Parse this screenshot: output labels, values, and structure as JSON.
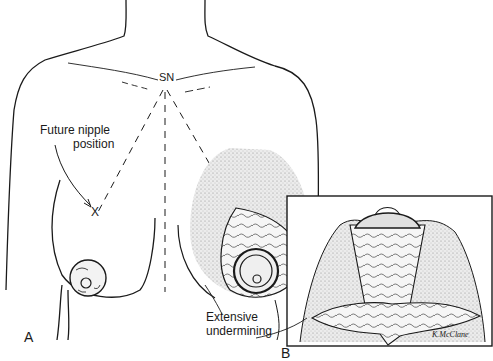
{
  "figure": {
    "panels": [
      {
        "id": "A",
        "label": "A"
      },
      {
        "id": "B",
        "label": "B"
      }
    ],
    "labels": {
      "sternal_notch": "SN",
      "future_nipple_line1": "Future nipple",
      "future_nipple_line2": "position",
      "nipple_marker": "X",
      "undermining_line1": "Extensive",
      "undermining_line2": "undermining",
      "signature": "K.McClane"
    },
    "colors": {
      "ink": "#1a1a1a",
      "stipple": "#c8c8c8",
      "background": "#ffffff"
    }
  }
}
